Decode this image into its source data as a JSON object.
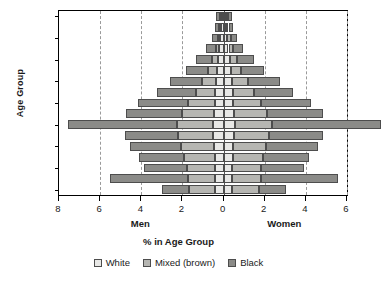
{
  "chart_data": {
    "type": "bar",
    "subtype": "population-pyramid-stacked",
    "title": "",
    "xlabel": "% in Age Group",
    "ylabel": "Age Group",
    "left_caption": "Men",
    "right_caption": "Women",
    "grid": true,
    "grid_style": "dashed-vertical",
    "legend_position": "bottom",
    "axis": {
      "left_max": 8,
      "right_max": 6,
      "tick_values": [
        8,
        6,
        4,
        2,
        0,
        2,
        4,
        6
      ],
      "tick_labels": [
        "8",
        "6",
        "4",
        "2",
        "0",
        "2",
        "4",
        "6"
      ],
      "gridline_values": [
        6,
        4,
        2,
        2,
        4
      ],
      "center_value": 0
    },
    "categories": [
      "80-84",
      "75-79",
      "70-74",
      "65-69",
      "60-64",
      "55-59",
      "50-54",
      "45-49",
      "40-44",
      "35-39",
      "30-34",
      "25-29",
      "20-24",
      "15-19",
      "10-14",
      "5-9",
      "0-4"
    ],
    "ytick_labels": [
      "80-84",
      "70-74",
      "60-64",
      "50-54",
      "40-44",
      "30-34",
      "20-24",
      "10-14",
      "0-4"
    ],
    "series": [
      {
        "name": "White",
        "color": "#e8e8e6",
        "men": [
          0.1,
          0.12,
          0.16,
          0.2,
          0.26,
          0.3,
          0.36,
          0.4,
          0.44,
          0.48,
          0.52,
          0.5,
          0.46,
          0.42,
          0.4,
          0.4,
          0.4
        ],
        "women": [
          0.12,
          0.14,
          0.18,
          0.24,
          0.3,
          0.34,
          0.4,
          0.44,
          0.48,
          0.52,
          0.56,
          0.52,
          0.48,
          0.44,
          0.42,
          0.42,
          0.42
        ]
      },
      {
        "name": "Mixed (brown)",
        "color": "#b6b6b2",
        "men": [
          0.06,
          0.08,
          0.12,
          0.18,
          0.3,
          0.45,
          0.7,
          0.95,
          1.3,
          1.55,
          1.75,
          1.7,
          1.6,
          1.5,
          1.4,
          1.35,
          1.3
        ],
        "women": [
          0.08,
          0.1,
          0.16,
          0.24,
          0.36,
          0.52,
          0.78,
          1.05,
          1.35,
          1.6,
          1.8,
          1.7,
          1.6,
          1.5,
          1.42,
          1.38,
          1.32
        ]
      },
      {
        "name": "Black",
        "color": "#8b8b88",
        "men": [
          0.2,
          0.22,
          0.3,
          0.45,
          0.8,
          1.1,
          1.55,
          1.9,
          2.4,
          2.7,
          5.3,
          2.6,
          2.5,
          2.2,
          2.05,
          3.75,
          1.3
        ]
      }
    ],
    "men_totals": [
      0.36,
      0.42,
      0.58,
      0.83,
      1.36,
      1.85,
      2.61,
      3.25,
      4.14,
      4.73,
      7.57,
      4.8,
      4.56,
      4.12,
      3.85,
      5.5,
      3.0
    ],
    "women_totals": [
      0.4,
      0.46,
      0.64,
      0.92,
      1.54,
      2.06,
      2.78,
      3.35,
      4.33,
      4.9,
      5.36,
      4.62,
      4.48,
      4.14,
      3.94,
      5.34,
      5.04
    ],
    "note": "Stacked horizontal bars; Men extend left of zero, Women right of zero."
  },
  "legend": {
    "items": [
      {
        "label": "White",
        "color": "#e8e8e6"
      },
      {
        "label": "Mixed (brown)",
        "color": "#b6b6b2"
      },
      {
        "label": "Black",
        "color": "#8b8b88"
      }
    ]
  }
}
